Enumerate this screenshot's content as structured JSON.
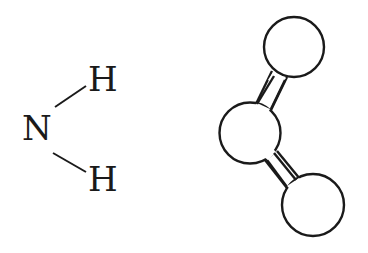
{
  "diagram": {
    "formula": {
      "center_atom": "N",
      "top_atom": "H",
      "bottom_atom": "H"
    },
    "model": {
      "type": "ball-and-stick",
      "atom_count": 3,
      "bond_count": 2
    },
    "colors": {
      "stroke": "#1a1a1a",
      "background": "#ffffff"
    }
  }
}
